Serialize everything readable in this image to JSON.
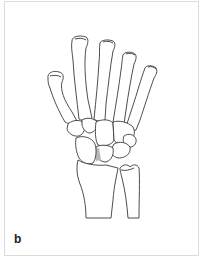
{
  "figure": {
    "panel_label": "b",
    "colors": {
      "line": "#3a3a3a",
      "frame": "#dcdcdc",
      "highlight": "#b8b8b8",
      "background": "#ffffff"
    }
  }
}
